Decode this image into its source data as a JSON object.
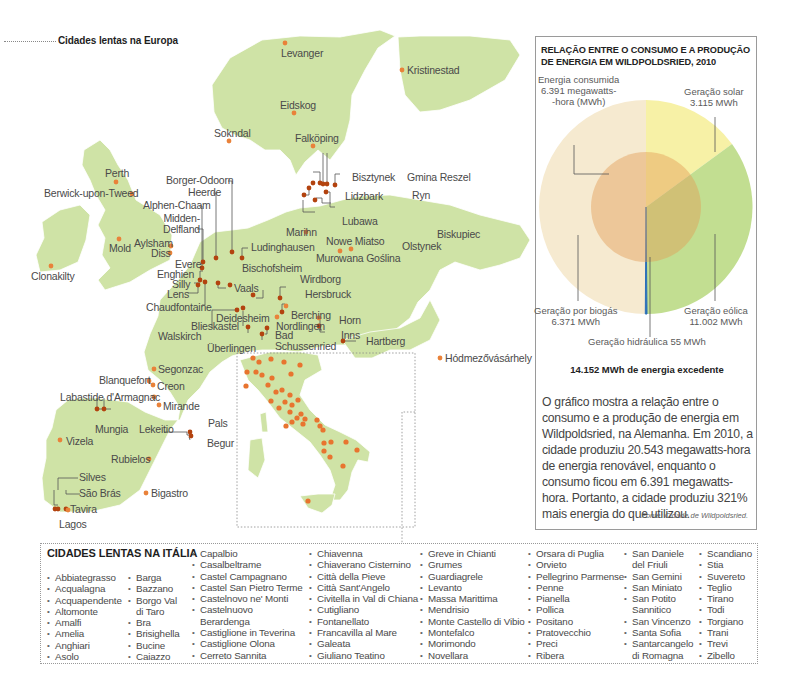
{
  "map": {
    "title": "Cidades lentas na Europa",
    "colors": {
      "land": "#cfe3a6",
      "city_dot": "#e9823a",
      "water": "#ffffff"
    },
    "cities": [
      {
        "name": "Levanger"
      },
      {
        "name": "Kristinestad"
      },
      {
        "name": "Eidskog"
      },
      {
        "name": "Sokndal"
      },
      {
        "name": "Falköping"
      },
      {
        "name": "Perth"
      },
      {
        "name": "Berwick-upon-Tweed"
      },
      {
        "name": "Borger-Odoorn"
      },
      {
        "name": "Heerde"
      },
      {
        "name": "Alphen-Chaam"
      },
      {
        "name": "Midden-\nDelfland"
      },
      {
        "name": "Bisztynek"
      },
      {
        "name": "Gmina Reszel"
      },
      {
        "name": "Lidzbark"
      },
      {
        "name": "Ryn"
      },
      {
        "name": "Lubawa"
      },
      {
        "name": "Biskupiec"
      },
      {
        "name": "Marihn"
      },
      {
        "name": "Nowe Miatso"
      },
      {
        "name": "Olstynek"
      },
      {
        "name": "Murowana Goślina"
      },
      {
        "name": "Mold"
      },
      {
        "name": "Aylsham"
      },
      {
        "name": "Diss"
      },
      {
        "name": "Ludinghausen"
      },
      {
        "name": "Clonakilty"
      },
      {
        "name": "Evere"
      },
      {
        "name": "Enghien"
      },
      {
        "name": "Silly"
      },
      {
        "name": "Lens"
      },
      {
        "name": "Vaals"
      },
      {
        "name": "Bischofsheim"
      },
      {
        "name": "Chaudfontaine"
      },
      {
        "name": "Wirdborg"
      },
      {
        "name": "Hersbruck"
      },
      {
        "name": "Deidesheim"
      },
      {
        "name": "Berching"
      },
      {
        "name": "Horn"
      },
      {
        "name": "Blieskastel"
      },
      {
        "name": "Nordlingen"
      },
      {
        "name": "Walskirch"
      },
      {
        "name": "Inns"
      },
      {
        "name": "Bad\nSchussenried"
      },
      {
        "name": "Hartberg"
      },
      {
        "name": "Überlingen"
      },
      {
        "name": "Hódmezővásárhely"
      },
      {
        "name": "Segonzac"
      },
      {
        "name": "Blanquefort"
      },
      {
        "name": "Creon"
      },
      {
        "name": "Labastide d'Armagnac"
      },
      {
        "name": "Mirande"
      },
      {
        "name": "Pals"
      },
      {
        "name": "Mungia"
      },
      {
        "name": "Lekeitio"
      },
      {
        "name": "Begur"
      },
      {
        "name": "Vizela"
      },
      {
        "name": "Rubielos"
      },
      {
        "name": "Silves"
      },
      {
        "name": "São Brás"
      },
      {
        "name": "Bigastro"
      },
      {
        "name": "Tavira"
      },
      {
        "name": "Lagos"
      }
    ]
  },
  "info": {
    "title": "RELAÇÃO ENTRE O CONSUMO E A PRODUÇÃO DE ENERGIA EM WILDPOLDSRIED, 2010",
    "labels": {
      "consumed": "Energia consumida\n6.391 megawatts-\n-hora (MWh)",
      "solar": "Geração solar\n3.115 MWh",
      "biogas": "Geração por biogás\n6.371 MWh",
      "wind": "Geração eólica\n11.002 MWh",
      "hydro": "Geração hidráulica 55 MWh"
    },
    "excess": "14.152 MWh de energia excedente",
    "description": "O gráfico mostra a relação entre o consumo e a produção de energia em Wildpoldsried, na Alemanha. Em 2010, a cidade produziu 20.543 megawatts-hora de energia renovável, enquanto o consumo ficou em 6.391 megawatts-hora. Portanto, a cidade produziu 321% mais energia do que utilizou.",
    "source": "Fonte: Cidade de Wildpoldsried."
  },
  "chart_data": {
    "type": "pie",
    "title": "RELAÇÃO ENTRE O CONSUMO E A PRODUÇÃO DE ENERGIA EM WILDPOLDSRIED, 2010",
    "unit": "MWh",
    "categories": [
      "Geração eólica",
      "Geração solar",
      "Geração por biogás",
      "Geração hidráulica"
    ],
    "values": [
      11002,
      3115,
      6371,
      55
    ],
    "colors": [
      "#bcdc8c",
      "#f5f0a8",
      "#f7eccf",
      "#2a6fb8"
    ],
    "total_production": 20543,
    "overlay": {
      "label": "Energia consumida",
      "value": 6391,
      "color": "#e8b27a"
    },
    "annotation": "14.152 MWh de energia excedente"
  },
  "italy_list": {
    "title": "CIDADES LENTAS NA ITÁLIA",
    "columns": [
      [
        "Abbiategrasso",
        "Acqualagna",
        "Acquapendente",
        "Altomonte",
        "Amalfi",
        "Amelia",
        "Anghiari",
        "Asolo"
      ],
      [
        "Barga",
        "Bazzano",
        "Borgo Val|di Taro",
        "Bra",
        "Brisighella",
        "Bucine",
        "Caiazzo"
      ],
      [
        "Capalbio",
        "Casalbeltrame",
        "Castel Campagnano",
        "Castel San Pietro Terme",
        "Castelnovo ne' Monti",
        "Castelnuovo|Berardenga",
        "Castiglione in Teverina",
        "Castiglione Olona",
        "Cerreto Sannita"
      ],
      [
        "Chiavenna",
        "Chiaverano Cisternino",
        "Città della Pieve",
        "Città Sant'Angelo",
        "Civitella in Val di Chiana",
        "Cutigliano",
        "Fontanellato",
        "Francavilla al Mare",
        "Galeata",
        "Giuliano Teatino"
      ],
      [
        "Greve in Chianti",
        "Grumes",
        "Guardiagrele",
        "Levanto",
        "Massa Marittima",
        "Mendrisio",
        "Monte Castello di Vibio",
        "Montefalco",
        "Morimondo",
        "Novellara"
      ],
      [
        "Orsara di Puglia",
        "Orvieto",
        "Pellegrino Parmense",
        "Penne",
        "Pianella",
        "Pollica",
        "Positano",
        "Pratovecchio",
        "Preci",
        "Ribera"
      ],
      [
        "San Daniele|del Friuli",
        "San Gemini",
        "San Miniato",
        "San Potito|Sannitico",
        "San Vincenzo",
        "Santa Sofia",
        "Santarcangelo|di Romagna"
      ],
      [
        "Scandiano",
        "Stia",
        "Suvereto",
        "Teglio",
        "Tirano",
        "Todi",
        "Torgiano",
        "Trani",
        "Trevi",
        "Zibello"
      ]
    ]
  }
}
